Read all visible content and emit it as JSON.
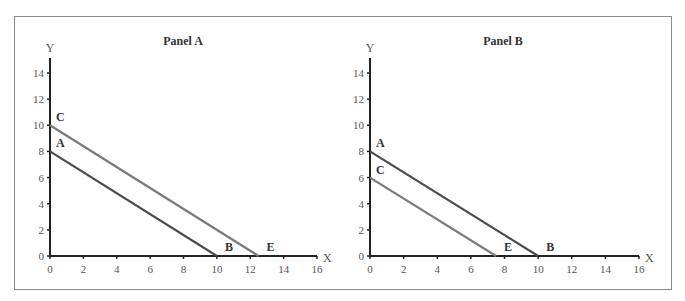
{
  "chart_data": [
    {
      "type": "line",
      "title": "Panel A",
      "xlabel": "X",
      "ylabel": "Y",
      "xlim": [
        0,
        16
      ],
      "ylim": [
        0,
        15
      ],
      "x_ticks": [
        0,
        2,
        4,
        6,
        8,
        10,
        12,
        14,
        16
      ],
      "y_ticks": [
        0,
        2,
        4,
        6,
        8,
        10,
        12,
        14
      ],
      "grid": false,
      "series": [
        {
          "name": "AB",
          "color": "#4a4a4a",
          "points": [
            [
              0,
              8
            ],
            [
              10,
              0
            ]
          ],
          "labels": [
            "A",
            "B"
          ]
        },
        {
          "name": "CE",
          "color": "#7a7a7a",
          "points": [
            [
              0,
              10
            ],
            [
              12.5,
              0
            ]
          ],
          "labels": [
            "C",
            "E"
          ]
        }
      ]
    },
    {
      "type": "line",
      "title": "Panel B",
      "xlabel": "X",
      "ylabel": "Y",
      "xlim": [
        0,
        16
      ],
      "ylim": [
        0,
        15
      ],
      "x_ticks": [
        0,
        2,
        4,
        6,
        8,
        10,
        12,
        14,
        16
      ],
      "y_ticks": [
        0,
        2,
        4,
        6,
        8,
        10,
        12,
        14
      ],
      "grid": false,
      "series": [
        {
          "name": "AB",
          "color": "#4a4a4a",
          "points": [
            [
              0,
              8
            ],
            [
              10,
              0
            ]
          ],
          "labels": [
            "A",
            "B"
          ]
        },
        {
          "name": "CE",
          "color": "#7a7a7a",
          "points": [
            [
              0,
              6
            ],
            [
              7.5,
              0
            ]
          ],
          "labels": [
            "C",
            "E"
          ]
        }
      ]
    }
  ]
}
